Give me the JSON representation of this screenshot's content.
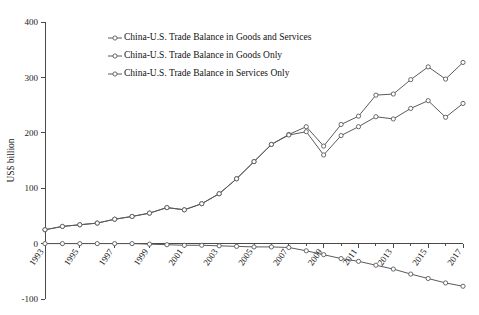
{
  "chart_data": {
    "type": "line",
    "title": "",
    "xlabel": "",
    "ylabel": "US$ billion",
    "ylim": [
      -100,
      400
    ],
    "ytick_values": [
      -100,
      0,
      100,
      200,
      300,
      400
    ],
    "ytick_labels": [
      "-100",
      "0",
      "100",
      "200",
      "300",
      "400"
    ],
    "xlim": [
      1993,
      2017
    ],
    "x": [
      1993,
      1994,
      1995,
      1996,
      1997,
      1998,
      1999,
      2000,
      2001,
      2002,
      2003,
      2004,
      2005,
      2006,
      2007,
      2008,
      2009,
      2010,
      2011,
      2012,
      2013,
      2014,
      2015,
      2016,
      2017
    ],
    "xtick_labels": [
      "1993",
      "1995",
      "1997",
      "1999",
      "2001",
      "2003",
      "2005",
      "2007",
      "2009",
      "2011",
      "2013",
      "2015",
      "2017"
    ],
    "xtick_values": [
      1993,
      1995,
      1997,
      1999,
      2001,
      2003,
      2005,
      2007,
      2009,
      2011,
      2013,
      2015,
      2017
    ],
    "grid": false,
    "legend_position": "upper-left-inside",
    "marker": "open-circle",
    "series": [
      {
        "name": "China-U.S. Trade Balance in Goods and Services",
        "values": [
          25,
          31,
          34,
          37,
          44,
          49,
          55,
          65,
          61,
          72,
          90,
          117,
          148,
          179,
          197,
          211,
          176,
          215,
          230,
          268,
          270,
          296,
          319,
          297,
          327
        ]
      },
      {
        "name": "China-U.S. Trade Balance in Goods Only",
        "values": [
          25,
          31,
          34,
          37,
          44,
          49,
          55,
          65,
          61,
          72,
          90,
          117,
          148,
          179,
          196,
          202,
          160,
          195,
          211,
          229,
          225,
          244,
          258,
          228,
          253
        ]
      },
      {
        "name": "China-U.S. Trade Balance in Services Only",
        "values": [
          0,
          0,
          0,
          0,
          0,
          0,
          -1,
          -2,
          -3,
          -3,
          -4,
          -5,
          -6,
          -6,
          -7,
          -13,
          -20,
          -27,
          -32,
          -39,
          -46,
          -55,
          -63,
          -71,
          -77
        ]
      }
    ]
  }
}
